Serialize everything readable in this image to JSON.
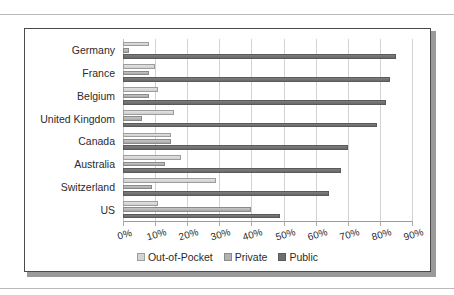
{
  "chart_data": {
    "type": "bar",
    "orientation": "horizontal",
    "title": "",
    "xlabel": "",
    "ylabel": "",
    "xlim": [
      0,
      90
    ],
    "xtick_labels": [
      "0%",
      "10%",
      "20%",
      "30%",
      "40%",
      "50%",
      "60%",
      "70%",
      "80%",
      "90%"
    ],
    "xtick_values": [
      0,
      10,
      20,
      30,
      40,
      50,
      60,
      70,
      80,
      90
    ],
    "grid": true,
    "legend_position": "bottom",
    "categories": [
      "Germany",
      "France",
      "Belgium",
      "United Kingdom",
      "Canada",
      "Australia",
      "Switzerland",
      "US"
    ],
    "series": [
      {
        "name": "Out-of-Pocket",
        "color": "#d4d4d4",
        "values": [
          8,
          10,
          11,
          16,
          15,
          18,
          29,
          11
        ]
      },
      {
        "name": "Private",
        "color": "#b2b2b2",
        "values": [
          2,
          8,
          8,
          6,
          15,
          13,
          9,
          40
        ]
      },
      {
        "name": "Public",
        "color": "#6f6f6f",
        "values": [
          85,
          83,
          82,
          79,
          70,
          68,
          64,
          49
        ]
      }
    ]
  }
}
